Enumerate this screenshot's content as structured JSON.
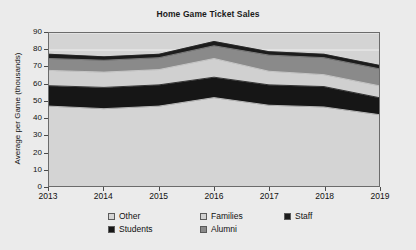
{
  "chart_data": {
    "type": "area",
    "stacked": true,
    "title": "Home Game Ticket Sales",
    "xlabel": "",
    "ylabel": "Average per Game (thousands)",
    "categories": [
      "2013",
      "2014",
      "2015",
      "2016",
      "2017",
      "2018",
      "2019"
    ],
    "x": [
      2013,
      2014,
      2015,
      2016,
      2017,
      2018,
      2019
    ],
    "ylim": [
      0,
      90
    ],
    "ytick_values": [
      0,
      10,
      20,
      30,
      40,
      50,
      60,
      70,
      80,
      90
    ],
    "ytick_labels": [
      "0",
      "10",
      "20",
      "30",
      "40",
      "50",
      "60",
      "70",
      "80",
      "90"
    ],
    "grid": true,
    "legend_position": "bottom",
    "series": [
      {
        "name": "Other",
        "color": "#d4d4d4",
        "values": [
          47,
          45.5,
          47,
          52,
          47.5,
          46.5,
          42
        ]
      },
      {
        "name": "Students",
        "color": "#161616",
        "values": [
          12,
          12.5,
          12.5,
          12,
          12,
          12,
          10
        ]
      },
      {
        "name": "Families",
        "color": "#d0d0d0",
        "values": [
          9,
          9,
          9,
          11,
          8,
          7,
          7
        ]
      },
      {
        "name": "Alumni",
        "color": "#8a8a8a",
        "values": [
          7,
          7,
          7,
          7.5,
          9.5,
          10,
          10
        ]
      },
      {
        "name": "Staff",
        "color": "#1c1c1c",
        "values": [
          2.5,
          2,
          2,
          2.5,
          2,
          2,
          2
        ]
      }
    ],
    "cumulative_tops": {
      "Other": [
        47,
        45.5,
        47,
        52,
        47.5,
        46.5,
        42
      ],
      "Students": [
        59,
        58,
        59.5,
        64,
        59.5,
        58.5,
        52
      ],
      "Families": [
        68,
        67,
        68.5,
        75,
        67.5,
        65.5,
        59
      ],
      "Alumni": [
        75,
        74,
        75.5,
        82.5,
        77,
        75.5,
        69
      ],
      "Staff": [
        77.5,
        76,
        77.5,
        85,
        79,
        77.5,
        71
      ]
    }
  },
  "legend": {
    "items": [
      {
        "label": "Other",
        "color": "#d4d4d4"
      },
      {
        "label": "Families",
        "color": "#d0d0d0"
      },
      {
        "label": "Staff",
        "color": "#1c1c1c"
      },
      {
        "label": "Students",
        "color": "#161616"
      },
      {
        "label": "Alumni",
        "color": "#8a8a8a"
      }
    ]
  },
  "style": {
    "plot_background": "#d4d4d4",
    "page_background": "#ebebeb",
    "axis_color": "#6b6b6b",
    "gridline_color": "#f0f0f0",
    "text_color": "#111111"
  }
}
